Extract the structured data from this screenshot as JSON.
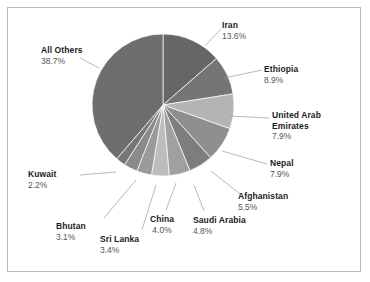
{
  "chart_data": {
    "type": "pie",
    "title": "",
    "subtitle": "",
    "xlabel": "",
    "ylabel": "",
    "legend_position": "none",
    "grid": false,
    "labels_show_percent": true,
    "categories": [
      "Iran",
      "Ethiopia",
      "United Arab Emirates",
      "Nepal",
      "Afghanistan",
      "Saudi Arabia",
      "China",
      "Sri Lanka",
      "Bhutan",
      "Kuwait",
      "All Others"
    ],
    "values": [
      13.6,
      8.9,
      7.9,
      7.9,
      5.5,
      4.8,
      4.0,
      3.4,
      3.1,
      2.2,
      38.7
    ],
    "value_labels": [
      "13.6%",
      "8.9%",
      "7.9%",
      "7.9%",
      "5.5%",
      "4.8%",
      "4.0%",
      "3.4%",
      "3.1%",
      "2.2%",
      "38.7%"
    ],
    "unit": "%",
    "slice_colors": [
      "#666666",
      "#757575",
      "#b4b4b4",
      "#8f8f8f",
      "#7d7d7d",
      "#a0a0a0",
      "#bdbdbd",
      "#9a9a9a",
      "#8a8a8a",
      "#777777",
      "#6e6e6e"
    ]
  },
  "slices": [
    {
      "name": "Iran",
      "percent": "13.6%"
    },
    {
      "name": "Ethiopia",
      "percent": "8.9%"
    },
    {
      "name": "United Arab",
      "name2": "Emirates",
      "percent": "7.9%"
    },
    {
      "name": "Nepal",
      "percent": "7.9%"
    },
    {
      "name": "Afghanistan",
      "percent": "5.5%"
    },
    {
      "name": "Saudi Arabia",
      "percent": "4.8%"
    },
    {
      "name": "China",
      "percent": "4.0%"
    },
    {
      "name": "Sri Lanka",
      "percent": "3.4%"
    },
    {
      "name": "Bhutan",
      "percent": "3.1%"
    },
    {
      "name": "Kuwait",
      "percent": "2.2%"
    },
    {
      "name": "All Others",
      "percent": "38.7%"
    }
  ],
  "style": {
    "frame_border_color": "#b8b8b8",
    "background": "#ffffff",
    "leader_line_color": "#9a9a9a",
    "label_name_color": "#1c1c1c",
    "label_value_color": "#555555"
  }
}
